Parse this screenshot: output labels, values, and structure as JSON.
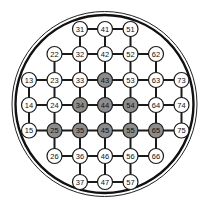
{
  "board": {
    "shape": "circle",
    "center": [
      104.5,
      104
    ],
    "outer_radius": 92.5,
    "inner_radius": 89,
    "grid": {
      "col_x": {
        "1": 29,
        "2": 54.5,
        "3": 80,
        "4": 105,
        "5": 130.5,
        "6": 156,
        "7": 181.5
      },
      "row_y": {
        "1": 29,
        "2": 54,
        "3": 80,
        "4": 105,
        "5": 130.5,
        "6": 156,
        "7": 182
      }
    },
    "node_radius": 7.5,
    "colors": {
      "empty_fill": "#ffffff",
      "filled_fill": "#8c8c8c",
      "stroke": "#1a1a1a",
      "line": "#1a1a1a"
    },
    "nodes": [
      {
        "id": "31",
        "filled": false
      },
      {
        "id": "41",
        "filled": false
      },
      {
        "id": "51",
        "filled": false
      },
      {
        "id": "22",
        "filled": false
      },
      {
        "id": "32",
        "filled": false
      },
      {
        "id": "42",
        "filled": false
      },
      {
        "id": "52",
        "filled": false
      },
      {
        "id": "62",
        "filled": false
      },
      {
        "id": "13",
        "filled": false
      },
      {
        "id": "23",
        "filled": false
      },
      {
        "id": "33",
        "filled": false
      },
      {
        "id": "43",
        "filled": true
      },
      {
        "id": "53",
        "filled": false
      },
      {
        "id": "63",
        "filled": false
      },
      {
        "id": "73",
        "filled": false
      },
      {
        "id": "14",
        "filled": false
      },
      {
        "id": "24",
        "filled": false
      },
      {
        "id": "34",
        "filled": true
      },
      {
        "id": "44",
        "filled": true
      },
      {
        "id": "54",
        "filled": true
      },
      {
        "id": "64",
        "filled": false
      },
      {
        "id": "74",
        "filled": false
      },
      {
        "id": "15",
        "filled": false
      },
      {
        "id": "25",
        "filled": true
      },
      {
        "id": "35",
        "filled": true
      },
      {
        "id": "45",
        "filled": true
      },
      {
        "id": "55",
        "filled": true
      },
      {
        "id": "65",
        "filled": true
      },
      {
        "id": "75",
        "filled": false
      },
      {
        "id": "26",
        "filled": false
      },
      {
        "id": "36",
        "filled": false
      },
      {
        "id": "46",
        "filled": false
      },
      {
        "id": "56",
        "filled": false
      },
      {
        "id": "66",
        "filled": false
      },
      {
        "id": "37",
        "filled": false
      },
      {
        "id": "47",
        "filled": false
      },
      {
        "id": "57",
        "filled": false
      }
    ]
  }
}
